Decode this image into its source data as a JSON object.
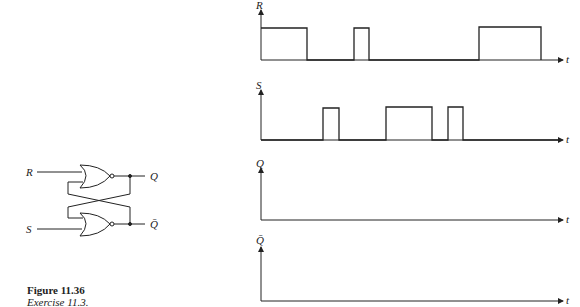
{
  "figure": {
    "title": "Figure 11.36",
    "subtitle": "Exercise 11.3."
  },
  "circuit": {
    "type": "SR latch (cross-coupled NOR gates)",
    "inputs": [
      "R",
      "S"
    ],
    "outputs": [
      "Q",
      "Q̄"
    ]
  },
  "timing": {
    "time_label": "t",
    "signals": [
      {
        "name": "R",
        "label": "R",
        "transitions": [
          [
            0,
            1
          ],
          [
            46,
            0
          ],
          [
            93,
            1
          ],
          [
            108,
            0
          ],
          [
            218,
            1
          ],
          [
            280,
            0
          ]
        ],
        "note": "given"
      },
      {
        "name": "S",
        "label": "S",
        "transitions": [
          [
            0,
            0
          ],
          [
            62,
            1
          ],
          [
            78,
            0
          ],
          [
            125,
            1
          ],
          [
            171,
            0
          ],
          [
            187,
            1
          ],
          [
            202,
            0
          ]
        ],
        "note": "given"
      },
      {
        "name": "Q",
        "label": "Q",
        "transitions": [],
        "note": "blank - to be drawn"
      },
      {
        "name": "Qbar",
        "label": "Q̄",
        "transitions": [],
        "note": "blank - to be drawn"
      }
    ]
  }
}
